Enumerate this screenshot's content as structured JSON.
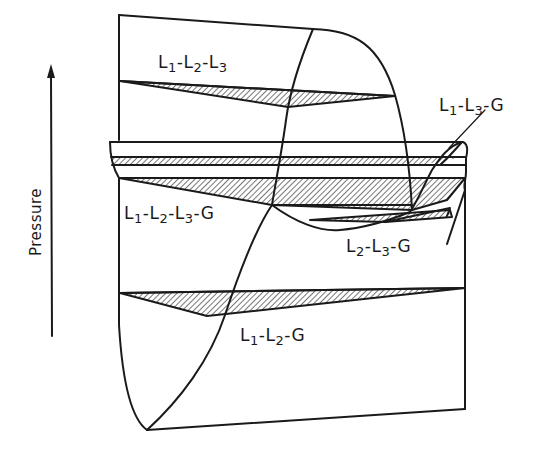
{
  "figure": {
    "type": "phase-diagram",
    "axis": {
      "label": "Pressure",
      "direction": "up"
    },
    "regions": [
      {
        "id": "l1-l2-l3",
        "label_parts": [
          "L",
          "1",
          "-L",
          "2",
          "-L",
          "3"
        ],
        "text": "L1-L2-L3"
      },
      {
        "id": "l1-l3-g",
        "label_parts": [
          "L",
          "1",
          "-L",
          "3",
          "-G"
        ],
        "text": "L1-L3-G"
      },
      {
        "id": "l1-l2-l3-g",
        "label_parts": [
          "L",
          "1",
          "-L",
          "2",
          "-L",
          "3",
          "-G"
        ],
        "text": "L1-L2-L3-G"
      },
      {
        "id": "l2-l3-g",
        "label_parts": [
          "L",
          "2",
          "-L",
          "3",
          "-G"
        ],
        "text": "L2-L3-G"
      },
      {
        "id": "l1-l2-g",
        "label_parts": [
          "L",
          "1",
          "-L",
          "2",
          "-G"
        ],
        "text": "L1-L2-G"
      }
    ],
    "colors": {
      "line": "#1a1a1a",
      "background": "#ffffff"
    }
  }
}
